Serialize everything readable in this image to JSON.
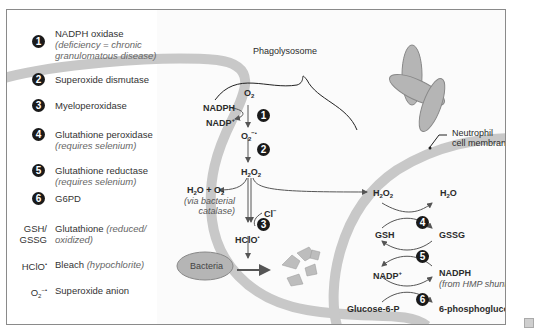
{
  "legend": {
    "items": [
      {
        "num": "1",
        "label": "NADPH oxidase",
        "note": "(deficiency = chronic granulomatous disease)"
      },
      {
        "num": "2",
        "label": "Superoxide dismutase",
        "note": ""
      },
      {
        "num": "3",
        "label": "Myeloperoxidase",
        "note": ""
      },
      {
        "num": "4",
        "label": "Glutathione peroxidase",
        "note": "(requires selenium)"
      },
      {
        "num": "5",
        "label": "Glutathione reductase",
        "note": "(requires selenium)"
      },
      {
        "num": "6",
        "label": "G6PD",
        "note": ""
      }
    ],
    "abbreviations": [
      {
        "abbr_line1": "GSH/",
        "abbr_line2": "GSSG",
        "label": "Glutathione",
        "note": "(reduced/ oxidized)"
      },
      {
        "abbr_line1": "HClO",
        "abbr_sup": "•",
        "label": "Bleach",
        "note": "(hypochlorite)"
      },
      {
        "abbr_line1": "O",
        "abbr_sub": "2",
        "abbr_sup": "−•",
        "label": "Superoxide anion",
        "note": ""
      }
    ]
  },
  "diagram": {
    "phagolysosome_label": "Phagolysosome",
    "membrane_label_line1": "Neutrophil",
    "membrane_label_line2": "cell membrane",
    "bacteria_label": "Bacteria",
    "pathway": {
      "o2": "O",
      "nadph": "NADPH",
      "nadp": "NADP",
      "superoxide": "O",
      "h2o2": "H",
      "h2o_o2": "H",
      "catalase_note_line1": "(via bacterial",
      "catalase_note_line2": "catalase)",
      "cl": "Cl",
      "hclo": "HClO",
      "badge1": "1",
      "badge2": "2",
      "badge3": "3"
    },
    "cycle": {
      "h2o2": "H",
      "h2o": "H",
      "gsh": "GSH",
      "gssg": "GSSG",
      "nadp": "NADP",
      "nadph": "NADPH",
      "hmp_note": "(from HMP shunt)",
      "glucose6p": "Glucose-6-P",
      "phosphogluconate": "6-phosphogluconate",
      "badge4": "4",
      "badge5": "5",
      "badge6": "6"
    }
  },
  "colors": {
    "membrane": "#c8c8c8",
    "bacteria_fill": "#b5b5b5",
    "badge": "#1a1a1a",
    "border": "#8a8a8a"
  }
}
